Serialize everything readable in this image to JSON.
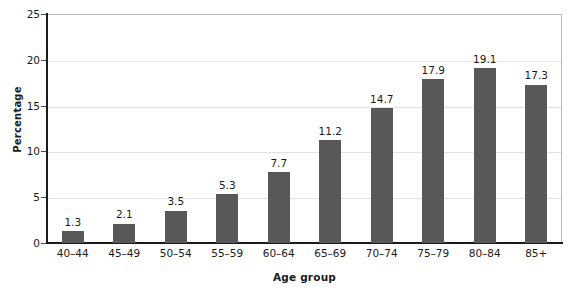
{
  "chart_data": {
    "type": "bar",
    "title": "",
    "xlabel": "Age group",
    "ylabel": "Percentage",
    "categories": [
      "40–44",
      "45–49",
      "50–54",
      "55–59",
      "60–64",
      "65–69",
      "70–74",
      "75–79",
      "80–84",
      "85+"
    ],
    "values": [
      1.3,
      2.1,
      3.5,
      5.3,
      7.7,
      11.2,
      14.7,
      17.9,
      19.1,
      17.3
    ],
    "value_labels": [
      "1.3",
      "2.1",
      "3.5",
      "5.3",
      "7.7",
      "11.2",
      "14.7",
      "17.9",
      "19.1",
      "17.3"
    ],
    "ylim": [
      0,
      25
    ],
    "y_ticks": [
      0,
      5,
      10,
      15,
      20,
      25
    ],
    "y_tick_labels": [
      "0",
      "5",
      "10",
      "15",
      "20",
      "25"
    ],
    "grid": "horizontal",
    "legend": "none",
    "bar_color": "#585858",
    "grid_color": "#e3e3e3",
    "axis_color": "#1b1b1b",
    "frame_color": "#b9b9b9",
    "text_color": "#1a1a1a"
  }
}
